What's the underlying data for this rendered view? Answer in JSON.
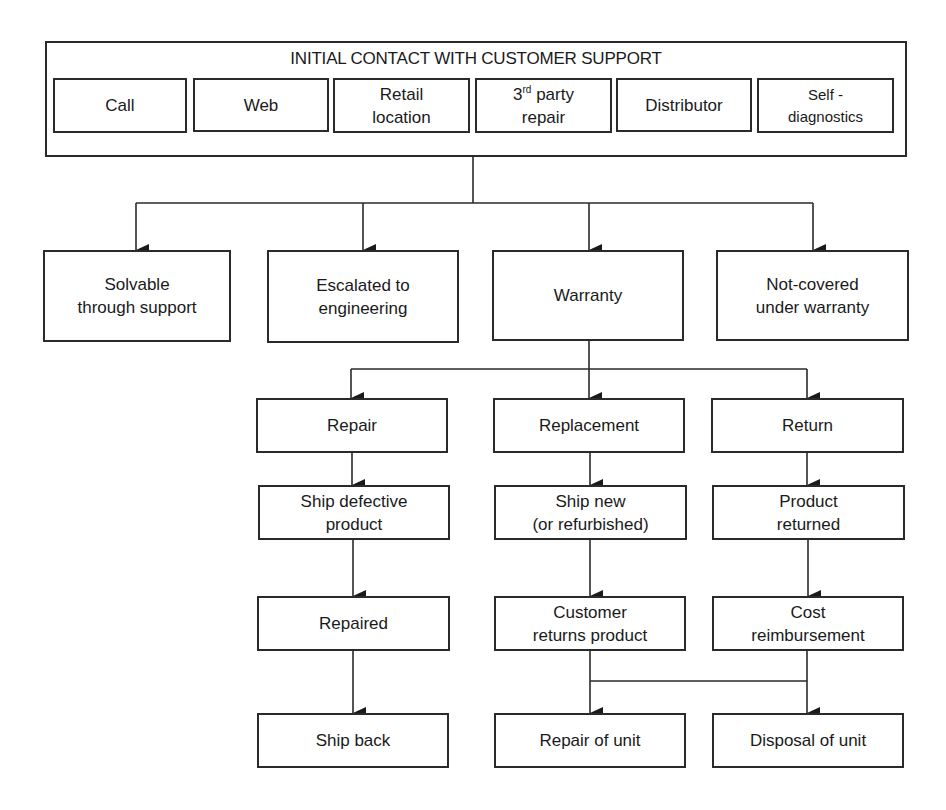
{
  "header": {
    "title": "INITIAL CONTACT WITH CUSTOMER SUPPORT",
    "channels": [
      {
        "label": "Call"
      },
      {
        "label": "Web"
      },
      {
        "label": "Retail location",
        "line1": "Retail",
        "line2": "location"
      },
      {
        "label": "3rd party repair",
        "line1_base": "3",
        "line1_sup": "rd",
        "line1_rest": " party",
        "line2": "repair"
      },
      {
        "label": "Distributor"
      },
      {
        "label": "Self - diagnostics",
        "line1": "Self -",
        "line2": "diagnostics"
      }
    ]
  },
  "outcomes": [
    {
      "label": "Solvable through support",
      "line1": "Solvable",
      "line2": "through support"
    },
    {
      "label": "Escalated to engineering",
      "line1": "Escalated to",
      "line2": "engineering"
    },
    {
      "label": "Warranty"
    },
    {
      "label": "Not-covered under warranty",
      "line1": "Not-covered",
      "line2": "under warranty"
    }
  ],
  "warranty_paths": {
    "repair": {
      "steps": [
        {
          "label": "Repair"
        },
        {
          "label": "Ship defective product",
          "line1": "Ship defective",
          "line2": "product"
        },
        {
          "label": "Repaired"
        },
        {
          "label": "Ship back"
        }
      ]
    },
    "replacement": {
      "steps": [
        {
          "label": "Replacement"
        },
        {
          "label": "Ship new (or refurbished)",
          "line1": "Ship new",
          "line2": "(or refurbished)"
        },
        {
          "label": "Customer returns product",
          "line1": "Customer",
          "line2": "returns product"
        },
        {
          "label": "Repair of unit"
        }
      ]
    },
    "return": {
      "steps": [
        {
          "label": "Return"
        },
        {
          "label": "Product returned",
          "line1": "Product",
          "line2": "returned"
        },
        {
          "label": "Cost reimbursement",
          "line1": "Cost",
          "line2": "reimbursement"
        },
        {
          "label": "Disposal of unit"
        }
      ]
    }
  },
  "colors": {
    "stroke": "#2a2a2a",
    "background": "#ffffff",
    "text": "#1a1a1a"
  }
}
